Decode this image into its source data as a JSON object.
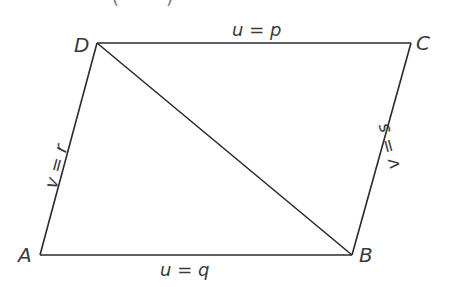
{
  "diagram": {
    "type": "parallelogram-with-diagonal",
    "top_cropped_text": "( )",
    "vertices": {
      "A": {
        "label": "A",
        "x": 40,
        "y": 255
      },
      "B": {
        "label": "B",
        "x": 352,
        "y": 255
      },
      "C": {
        "label": "C",
        "x": 411,
        "y": 43
      },
      "D": {
        "label": "D",
        "x": 97,
        "y": 43
      }
    },
    "sides": {
      "top": {
        "label": "u = p",
        "from": "D",
        "to": "C"
      },
      "bottom": {
        "label": "u = q",
        "from": "A",
        "to": "B"
      },
      "left": {
        "label": "v = r",
        "from": "A",
        "to": "D"
      },
      "right": {
        "label": "v = s",
        "from": "B",
        "to": "C"
      }
    },
    "diagonal": {
      "from": "D",
      "to": "B"
    }
  }
}
